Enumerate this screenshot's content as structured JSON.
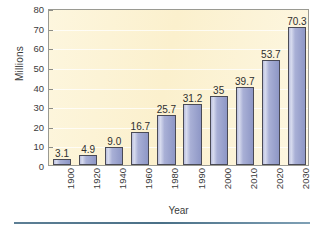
{
  "chart_data": {
    "type": "bar",
    "title": "",
    "xlabel": "Year",
    "ylabel": "Millions",
    "categories": [
      "1900",
      "1920",
      "1940",
      "1960",
      "1980",
      "1990",
      "2000",
      "2010",
      "2020",
      "2030"
    ],
    "values": [
      3.1,
      4.9,
      9.0,
      16.7,
      25.7,
      31.2,
      35,
      39.7,
      53.7,
      70.3
    ],
    "value_labels": [
      "3.1",
      "4.9",
      "9.0",
      "16.7",
      "25.7",
      "31.2",
      "35",
      "39.7",
      "53.7",
      "70.3"
    ],
    "ylim": [
      0,
      80
    ],
    "ytick_labels": [
      "0",
      "10",
      "20",
      "30",
      "40",
      "50",
      "60",
      "70",
      "80"
    ],
    "ytick_values": [
      0,
      10,
      20,
      30,
      40,
      50,
      60,
      70,
      80
    ],
    "grid": true,
    "legend": "none",
    "colors": {
      "bar_fill": "#a9b0d6",
      "bar_highlight": "#d8dcef",
      "bar_border": "#4a4a55",
      "plot_background": "#fcf2d3",
      "plot_border": "#9a9a92",
      "text": "#3b3b3b",
      "bottom_rule": "#4a7087",
      "page_background": "#ffffff"
    }
  }
}
